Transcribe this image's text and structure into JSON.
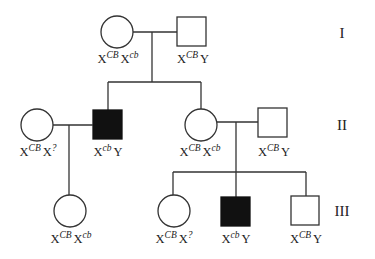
{
  "diagram": {
    "type": "pedigree",
    "generations": [
      {
        "label": "I"
      },
      {
        "label": "II"
      },
      {
        "label": "III"
      }
    ],
    "individuals": {
      "I1": {
        "sex": "female",
        "affected": false,
        "genotype": {
          "a_base": "X",
          "a_sup": "CB",
          "b_base": "X",
          "b_sup": "cb"
        }
      },
      "I2": {
        "sex": "male",
        "affected": false,
        "genotype": {
          "a_base": "X",
          "a_sup": "CB",
          "b_base": "Y",
          "b_sup": ""
        }
      },
      "II1": {
        "sex": "female",
        "affected": false,
        "genotype": {
          "a_base": "X",
          "a_sup": "CB",
          "b_base": "X",
          "b_sup": "?"
        }
      },
      "II2": {
        "sex": "male",
        "affected": true,
        "genotype": {
          "a_base": "X",
          "a_sup": "cb",
          "b_base": "Y",
          "b_sup": ""
        }
      },
      "II3": {
        "sex": "female",
        "affected": false,
        "genotype": {
          "a_base": "X",
          "a_sup": "CB",
          "b_base": "X",
          "b_sup": "cb"
        }
      },
      "II4": {
        "sex": "male",
        "affected": false,
        "genotype": {
          "a_base": "X",
          "a_sup": "CB",
          "b_base": "Y",
          "b_sup": ""
        }
      },
      "III1": {
        "sex": "female",
        "affected": false,
        "genotype": {
          "a_base": "X",
          "a_sup": "CB",
          "b_base": "X",
          "b_sup": "cb"
        }
      },
      "III2": {
        "sex": "female",
        "affected": false,
        "genotype": {
          "a_base": "X",
          "a_sup": "CB",
          "b_base": "X",
          "b_sup": "?"
        }
      },
      "III3": {
        "sex": "male",
        "affected": true,
        "genotype": {
          "a_base": "X",
          "a_sup": "cb",
          "b_base": "Y",
          "b_sup": ""
        }
      },
      "III4": {
        "sex": "male",
        "affected": false,
        "genotype": {
          "a_base": "X",
          "a_sup": "CB",
          "b_base": "Y",
          "b_sup": ""
        }
      }
    },
    "matings": [
      {
        "partners": [
          "I1",
          "I2"
        ],
        "children": [
          "II2",
          "II3"
        ]
      },
      {
        "partners": [
          "II1",
          "II2"
        ],
        "children": [
          "III1"
        ]
      },
      {
        "partners": [
          "II3",
          "II4"
        ],
        "children": [
          "III2",
          "III3",
          "III4"
        ]
      }
    ],
    "colors": {
      "line": "#333333",
      "affected_fill": "#111111",
      "unaffected_fill": "#ffffff"
    }
  }
}
